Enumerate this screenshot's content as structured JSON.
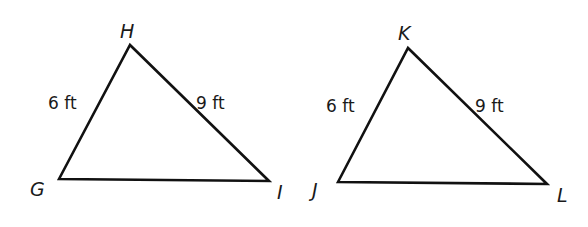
{
  "figure": {
    "background": "#ffffff",
    "line_color": "#111111",
    "triangles": [
      {
        "name": "GHI",
        "vertices": {
          "G": {
            "label": "G",
            "x": 59,
            "y": 179
          },
          "H": {
            "label": "H",
            "x": 130,
            "y": 45
          },
          "I": {
            "label": "I",
            "x": 269,
            "y": 181
          }
        },
        "side_labels": {
          "GH": "6 ft",
          "HI": "9 ft"
        }
      },
      {
        "name": "JKL",
        "vertices": {
          "J": {
            "label": "J",
            "x": 338,
            "y": 182
          },
          "K": {
            "label": "K",
            "x": 408,
            "y": 48
          },
          "L": {
            "label": "L",
            "x": 547,
            "y": 184
          }
        },
        "side_labels": {
          "JK": "6 ft",
          "KL": "9 ft"
        }
      }
    ]
  }
}
